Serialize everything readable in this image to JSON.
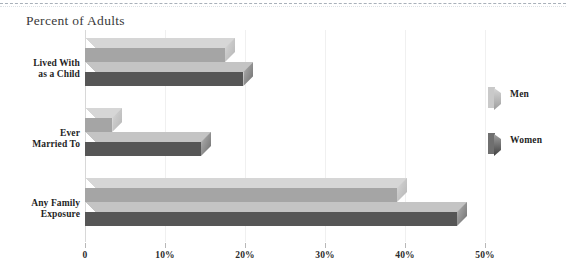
{
  "page": {
    "width": 566,
    "height": 276,
    "background": "#ffffff",
    "top_rule": "dashed-rule"
  },
  "chart_data": {
    "type": "bar",
    "orientation": "horizontal",
    "style": "3d",
    "title": "Percent of Adults",
    "xlabel": "",
    "ylabel": "",
    "categories": [
      "Lived With\nas a Child",
      "Ever\nMarried To",
      "Any Family\nExposure"
    ],
    "category_lines": [
      [
        "Lived With",
        "as a Child"
      ],
      [
        "Ever",
        "Married To"
      ],
      [
        "Any Family",
        "Exposure"
      ]
    ],
    "series": [
      {
        "name": "Men",
        "color": "#a5a5a5",
        "top_color": "#d6d6d6",
        "values": [
          17.5,
          3.4,
          39.0
        ]
      },
      {
        "name": "Women",
        "color": "#565656",
        "top_color": "#c4c4c4",
        "values": [
          19.8,
          14.5,
          46.5
        ]
      }
    ],
    "xlim": [
      0,
      50
    ],
    "xticks": [
      0,
      10,
      20,
      30,
      40,
      50
    ],
    "xticklabels": [
      "0",
      "10%",
      "20%",
      "30%",
      "40%",
      "50%"
    ],
    "grid": true,
    "gridlines_at": [
      0,
      10,
      20,
      30,
      40,
      50
    ],
    "legend": {
      "position": "right",
      "entries": [
        "Men",
        "Women"
      ]
    }
  },
  "legend": {
    "items": [
      {
        "label": "Men",
        "series_key": "men"
      },
      {
        "label": "Women",
        "series_key": "women"
      }
    ]
  }
}
